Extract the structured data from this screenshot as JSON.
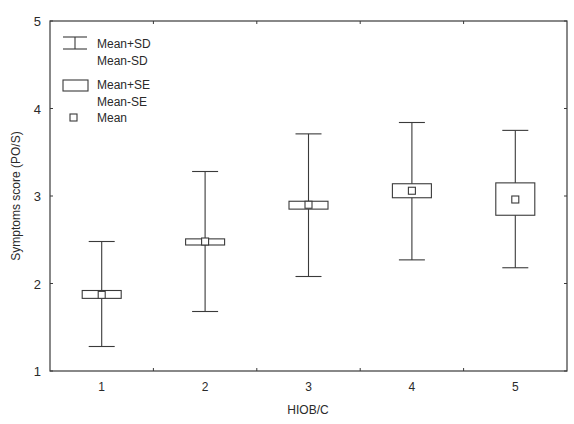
{
  "chart_data": {
    "type": "box",
    "title": "",
    "xlabel": "HIOB/C",
    "ylabel": "Symptoms score (PO/S)",
    "ylim": [
      1,
      5
    ],
    "yticks": [
      "1",
      "2",
      "3",
      "4",
      "5"
    ],
    "categories": [
      "1",
      "2",
      "3",
      "4",
      "5"
    ],
    "grid": false,
    "legend_position": "top-left inside",
    "legend": [
      {
        "symbol": "whisker",
        "lines": [
          "Mean+SD",
          "Mean-SD"
        ]
      },
      {
        "symbol": "box",
        "lines": [
          "Mean+SE",
          "Mean-SE"
        ]
      },
      {
        "symbol": "square",
        "lines": [
          "Mean"
        ]
      }
    ],
    "series": [
      {
        "category": "1",
        "mean": 1.87,
        "mean_plus_se": 1.92,
        "mean_minus_se": 1.83,
        "mean_plus_sd": 2.48,
        "mean_minus_sd": 1.28
      },
      {
        "category": "2",
        "mean": 2.48,
        "mean_plus_se": 2.51,
        "mean_minus_se": 2.44,
        "mean_plus_sd": 3.28,
        "mean_minus_sd": 1.68
      },
      {
        "category": "3",
        "mean": 2.9,
        "mean_plus_se": 2.94,
        "mean_minus_se": 2.85,
        "mean_plus_sd": 3.71,
        "mean_minus_sd": 2.08
      },
      {
        "category": "4",
        "mean": 3.06,
        "mean_plus_se": 3.14,
        "mean_minus_se": 2.98,
        "mean_plus_sd": 3.84,
        "mean_minus_sd": 2.27
      },
      {
        "category": "5",
        "mean": 2.96,
        "mean_plus_se": 3.15,
        "mean_minus_se": 2.78,
        "mean_plus_sd": 3.75,
        "mean_minus_sd": 2.18
      }
    ]
  },
  "colors": {
    "line": "#3a3a3a",
    "text": "#2a2a2a",
    "background": "#ffffff"
  }
}
